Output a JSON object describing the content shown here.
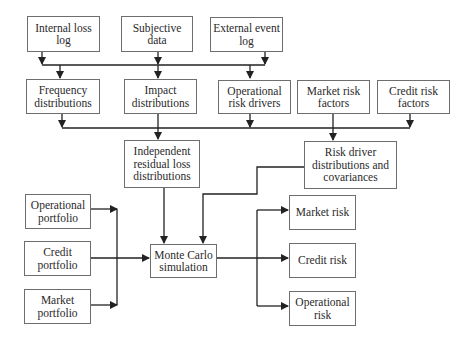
{
  "diagram": {
    "type": "flowchart",
    "colors": {
      "line": "#222222",
      "box_border": "#6e6e6e",
      "text": "#2a2a2a",
      "background": "#ffffff"
    },
    "nodes": {
      "internal_loss_log": {
        "label": "Internal loss log"
      },
      "subjective_data": {
        "label": "Subjective data"
      },
      "external_event_log": {
        "label": "External event log"
      },
      "frequency_distributions": {
        "label": "Frequency distributions"
      },
      "impact_distributions": {
        "label": "Impact distributions"
      },
      "operational_risk_drivers": {
        "label": "Operational risk drivers"
      },
      "market_risk_factors": {
        "label": "Market risk factors"
      },
      "credit_risk_factors": {
        "label": "Credit risk factors"
      },
      "independent_residual_loss": {
        "label": "Independent residual loss distributions"
      },
      "risk_driver_distributions": {
        "label": "Risk driver distributions and covariances"
      },
      "operational_portfolio": {
        "label": "Operational portfolio"
      },
      "credit_portfolio": {
        "label": "Credit portfolio"
      },
      "market_portfolio": {
        "label": "Market portfolio"
      },
      "monte_carlo": {
        "label": "Monte Carlo simulation"
      },
      "market_risk": {
        "label": "Market risk"
      },
      "credit_risk": {
        "label": "Credit risk"
      },
      "operational_risk": {
        "label": "Operational risk"
      }
    },
    "edges": [
      {
        "from": [
          "internal_loss_log",
          "subjective_data",
          "external_event_log"
        ],
        "to": [
          "frequency_distributions",
          "impact_distributions",
          "operational_risk_drivers"
        ]
      },
      {
        "from": [
          "frequency_distributions",
          "impact_distributions",
          "operational_risk_drivers",
          "market_risk_factors",
          "credit_risk_factors"
        ],
        "to": [
          "independent_residual_loss",
          "risk_driver_distributions"
        ]
      },
      {
        "from": "independent_residual_loss",
        "to": "monte_carlo"
      },
      {
        "from": "risk_driver_distributions",
        "to": "monte_carlo"
      },
      {
        "from": [
          "operational_portfolio",
          "credit_portfolio",
          "market_portfolio"
        ],
        "to": "monte_carlo"
      },
      {
        "from": "monte_carlo",
        "to": [
          "market_risk",
          "credit_risk",
          "operational_risk"
        ]
      }
    ]
  }
}
